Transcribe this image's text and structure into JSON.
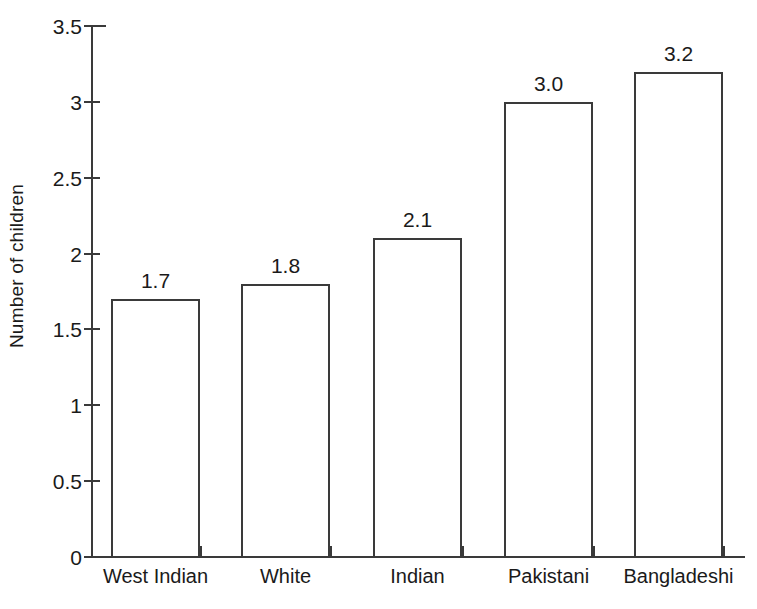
{
  "chart_data": {
    "type": "bar",
    "title": "",
    "xlabel": "",
    "ylabel": "Number of children",
    "categories": [
      "West Indian",
      "White",
      "Indian",
      "Pakistani",
      "Bangladeshi"
    ],
    "values": [
      1.7,
      1.8,
      2.1,
      3.0,
      3.2
    ],
    "value_labels": [
      "1.7",
      "1.8",
      "2.1",
      "3.0",
      "3.2"
    ],
    "ylim": [
      0,
      3.5
    ],
    "ytick_values": [
      0,
      0.5,
      1,
      1.5,
      2,
      2.5,
      3,
      3.5
    ],
    "ytick_labels": [
      "0",
      "0.5",
      "1",
      "1.5",
      "2",
      "2.5",
      "3",
      "3.5"
    ],
    "grid": false,
    "legend": "none",
    "bar_fill": "#ffffff",
    "bar_outline": "#3a3a3a",
    "axis_color": "#3a3a3a",
    "background": "#ffffff",
    "text_color": "#1a1a1a"
  }
}
